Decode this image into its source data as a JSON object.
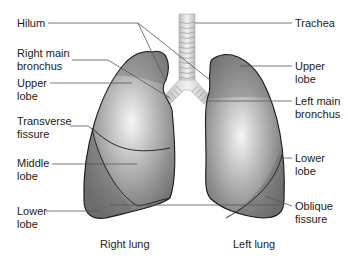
{
  "diagram": {
    "labels_left": [
      {
        "id": "hilum",
        "text": "Hilum"
      },
      {
        "id": "right-main-bronchus",
        "text": "Right main\nbronchus"
      },
      {
        "id": "right-upper-lobe",
        "text": "Upper\nlobe"
      },
      {
        "id": "transverse-fissure",
        "text": "Transverse\nfissure"
      },
      {
        "id": "middle-lobe",
        "text": "Middle\nlobe"
      },
      {
        "id": "right-lower-lobe",
        "text": "Lower\nlobe"
      }
    ],
    "labels_right": [
      {
        "id": "trachea",
        "text": "Trachea"
      },
      {
        "id": "left-upper-lobe",
        "text": "Upper\nlobe"
      },
      {
        "id": "left-main-bronchus",
        "text": "Left main\nbronchus"
      },
      {
        "id": "left-lower-lobe",
        "text": "Lower\nlobe"
      },
      {
        "id": "oblique-fissure",
        "text": "Oblique\nfissure"
      }
    ],
    "captions": {
      "right_lung": "Right lung",
      "left_lung": "Left lung"
    },
    "colors": {
      "lung_dark": "#6e6e6e",
      "lung_mid": "#9a9a9a",
      "lung_highlight": "#f4f4f4",
      "outline": "#1a1a1a",
      "leader_line": "#555555",
      "trachea": "#dcdcdc"
    }
  }
}
